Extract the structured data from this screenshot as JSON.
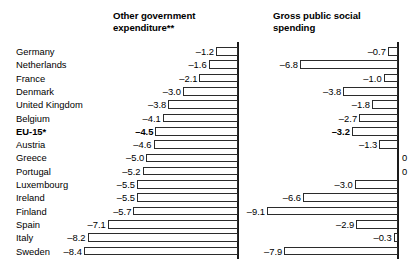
{
  "chart_data": {
    "type": "bar",
    "orientation": "horizontal",
    "title": "",
    "panels": [
      {
        "title": "Other government\nexpenditure**",
        "xlabel": "",
        "ylabel": "",
        "zero_axis": "right",
        "direction": "left",
        "values": [
          -1.2,
          -1.6,
          -2.1,
          -3.0,
          -3.8,
          -4.1,
          -4.5,
          -4.6,
          -5.0,
          -5.2,
          -5.5,
          -5.5,
          -5.7,
          -7.1,
          -8.2,
          -8.4
        ],
        "labels": [
          "–1.2",
          "–1.6",
          "–2.1",
          "–3.0",
          "–3.8",
          "–4.1",
          "–4.5",
          "–4.6",
          "–5.0",
          "–5.2",
          "–5.5",
          "–5.5",
          "–5.7",
          "–7.1",
          "–8.2",
          "–8.4"
        ]
      },
      {
        "title": "Gross public social\nspending",
        "xlabel": "",
        "ylabel": "",
        "zero_axis": "right",
        "direction": "left",
        "values": [
          -0.7,
          -6.8,
          -1.0,
          -3.8,
          -1.8,
          -2.7,
          -3.2,
          -1.3,
          0,
          0,
          -3.0,
          -6.6,
          -9.1,
          -2.9,
          -0.3,
          -7.9
        ],
        "labels": [
          "–0.7",
          "–6.8",
          "–1.0",
          "–3.8",
          "–1.8",
          "–2.7",
          "–3.2",
          "–1.3",
          "0",
          "0",
          "–3.0",
          "–6.6",
          "–9.1",
          "–2.9",
          "–0.3",
          "–7.9"
        ]
      }
    ],
    "categories": [
      "Germany",
      "Netherlands",
      "France",
      "Denmark",
      "United Kingdom",
      "Belgium",
      "EU-15*",
      "Austria",
      "Greece",
      "Portugal",
      "Luxembourg",
      "Ireland",
      "Finland",
      "Spain",
      "Italy",
      "Sweden"
    ],
    "highlight_category": "EU-15*",
    "grid": false,
    "legend": "none"
  },
  "rows": [
    {
      "country": "Germany",
      "v1": -1.2,
      "l1": "–1.2",
      "v2": -0.7,
      "l2": "–0.7",
      "bold": false
    },
    {
      "country": "Netherlands",
      "v1": -1.6,
      "l1": "–1.6",
      "v2": -6.8,
      "l2": "–6.8",
      "bold": false
    },
    {
      "country": "France",
      "v1": -2.1,
      "l1": "–2.1",
      "v2": -1.0,
      "l2": "–1.0",
      "bold": false
    },
    {
      "country": "Denmark",
      "v1": -3.0,
      "l1": "–3.0",
      "v2": -3.8,
      "l2": "–3.8",
      "bold": false
    },
    {
      "country": "United Kingdom",
      "v1": -3.8,
      "l1": "–3.8",
      "v2": -1.8,
      "l2": "–1.8",
      "bold": false
    },
    {
      "country": "Belgium",
      "v1": -4.1,
      "l1": "–4.1",
      "v2": -2.7,
      "l2": "–2.7",
      "bold": false
    },
    {
      "country": "EU-15*",
      "v1": -4.5,
      "l1": "–4.5",
      "v2": -3.2,
      "l2": "–3.2",
      "bold": true
    },
    {
      "country": "Austria",
      "v1": -4.6,
      "l1": "–4.6",
      "v2": -1.3,
      "l2": "–1.3",
      "bold": false
    },
    {
      "country": "Greece",
      "v1": -5.0,
      "l1": "–5.0",
      "v2": 0.0,
      "l2": "0",
      "bold": false
    },
    {
      "country": "Portugal",
      "v1": -5.2,
      "l1": "–5.2",
      "v2": 0.0,
      "l2": "0",
      "bold": false
    },
    {
      "country": "Luxembourg",
      "v1": -5.5,
      "l1": "–5.5",
      "v2": -3.0,
      "l2": "–3.0",
      "bold": false
    },
    {
      "country": "Ireland",
      "v1": -5.5,
      "l1": "–5.5",
      "v2": -6.6,
      "l2": "–6.6",
      "bold": false
    },
    {
      "country": "Finland",
      "v1": -5.7,
      "l1": "–5.7",
      "v2": -9.1,
      "l2": "–9.1",
      "bold": false
    },
    {
      "country": "Spain",
      "v1": -7.1,
      "l1": "–7.1",
      "v2": -2.9,
      "l2": "–2.9",
      "bold": false
    },
    {
      "country": "Italy",
      "v1": -8.2,
      "l1": "–8.2",
      "v2": -0.3,
      "l2": "–0.3",
      "bold": false
    },
    {
      "country": "Sweden",
      "v1": -8.4,
      "l1": "–8.4",
      "v2": -7.9,
      "l2": "–7.9",
      "bold": false
    }
  ],
  "headers": {
    "panel1": "Other government\nexpenditure**",
    "panel2": "Gross public social\nspending"
  },
  "colors": {
    "bar_outline": "#2b2b2b",
    "bar_fill": "#ffffff",
    "axis": "#1a1a1a",
    "text": "#000000",
    "background": "#ffffff"
  }
}
